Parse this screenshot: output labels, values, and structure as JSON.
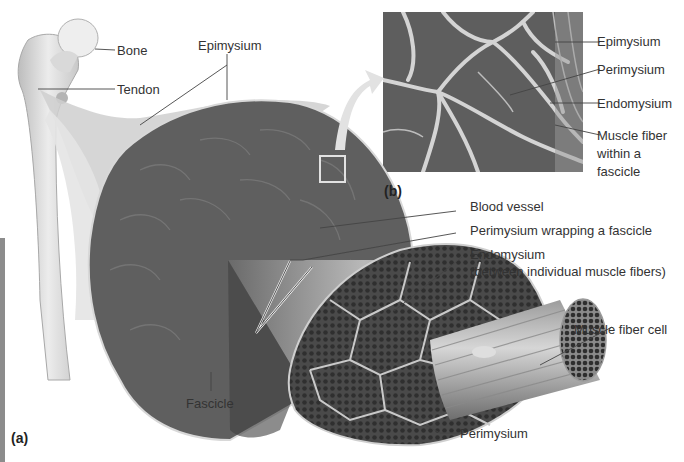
{
  "figure": {
    "panel_a_label": "(a)",
    "panel_b_label": "(b)",
    "colors": {
      "muscle_dark": "#5a5a5a",
      "connective_light": "#d8d8d8",
      "label_line": "#444444",
      "left_bar": "#8c8c8c",
      "arrow": "#e2e2e2"
    }
  },
  "panel_a": {
    "labels": {
      "bone": "Bone",
      "tendon": "Tendon",
      "epimysium": "Epimysium",
      "blood_vessel": "Blood vessel",
      "perimysium_wrapping": "Perimysium wrapping a fascicle",
      "endomysium_line1": "Endomysium",
      "endomysium_line2": "(between individual muscle fibers)",
      "muscle_fiber_cell": "Muscle fiber cell",
      "fascicle": "Fascicle",
      "perimysium": "Perimysium"
    }
  },
  "panel_b": {
    "labels": {
      "epimysium": "Epimysium",
      "perimysium": "Perimysium",
      "endomysium": "Endomysium",
      "muscle_fiber_line1": "Muscle fiber",
      "muscle_fiber_line2": "within a",
      "muscle_fiber_line3": "fascicle"
    }
  }
}
